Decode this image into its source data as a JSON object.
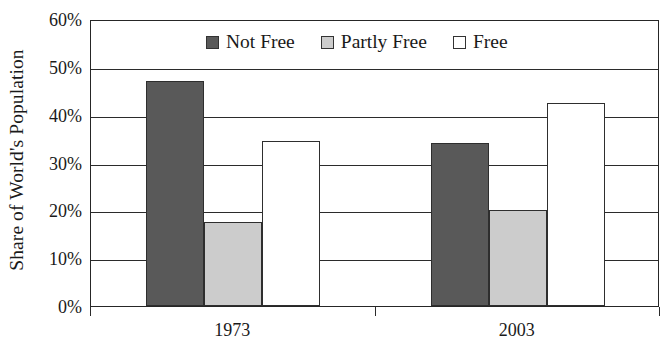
{
  "chart_data": {
    "type": "bar",
    "title": "",
    "subtitle": "",
    "xlabel": "",
    "ylabel": "Share of World's Population",
    "categories": [
      "1973",
      "2003"
    ],
    "series": [
      {
        "name": "Not Free",
        "values": [
          47.0,
          34.0
        ],
        "color": "#595959"
      },
      {
        "name": "Partly Free",
        "values": [
          17.5,
          20.0
        ],
        "color": "#cccccc"
      },
      {
        "name": "Free",
        "values": [
          34.5,
          42.5
        ],
        "color": "#ffffff"
      }
    ],
    "ylim": [
      0,
      60
    ],
    "ytick_values": [
      0,
      10,
      20,
      30,
      40,
      50,
      60
    ],
    "ytick_labels": [
      "0%",
      "10%",
      "20%",
      "30%",
      "40%",
      "50%",
      "60%"
    ],
    "grid": true,
    "legend_position": "top-center"
  },
  "legend": {
    "items": [
      {
        "label": "Not Free",
        "swatch": "legend-swatch-not-free"
      },
      {
        "label": "Partly Free",
        "swatch": "legend-swatch-partly-free"
      },
      {
        "label": "Free",
        "swatch": "legend-swatch-free"
      }
    ]
  }
}
